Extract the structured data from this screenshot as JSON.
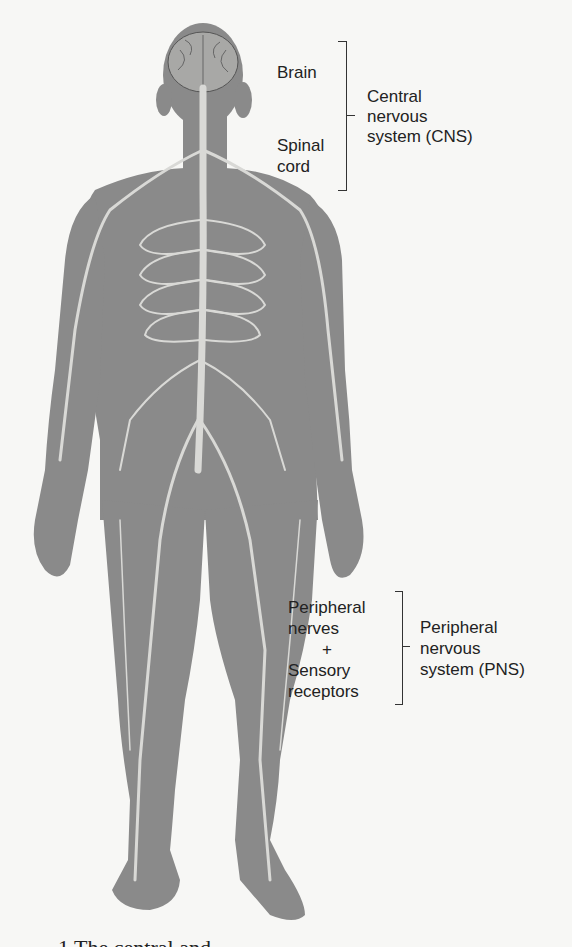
{
  "figure": {
    "colors": {
      "background": "#f7f7f5",
      "body": "#8a8a8a",
      "nerve": "#d9d9d6",
      "text": "#222222"
    },
    "cns": {
      "parts": [
        "Brain",
        "Spinal",
        "cord"
      ],
      "group_label": [
        "Central",
        "nervous",
        "system (CNS)"
      ]
    },
    "pns": {
      "parts": [
        "Peripheral",
        "nerves",
        "+",
        "Sensory",
        "receptors"
      ],
      "group_label": [
        "Peripheral",
        "nervous",
        "system (PNS)"
      ]
    },
    "caption": "1   The central and"
  }
}
